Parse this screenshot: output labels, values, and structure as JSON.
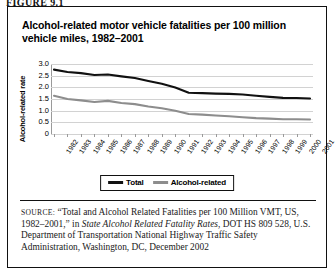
{
  "figure_label": "FIGURE 9.1",
  "title": "Alcohol-related motor vehicle fatalities per 100 million vehicle miles, 1982–2001",
  "legend": {
    "total_label": "Total",
    "alcohol_label": "Alcohol-related",
    "total_color": "#111111",
    "alcohol_color": "#8d8d8d"
  },
  "source": {
    "prefix": "SOURCE:",
    "part1": " “Total and Alcohol Related Fatalities per 100 Million VMT, US, 1982–2001,” in ",
    "italic": "State Alcohol Related Fatality Rates",
    "part2": ", DOT HS 809 528, U.S. Department of Transportation National Highway Traffic Safety Administration, Washington, DC, December 2002"
  },
  "chart_data": {
    "type": "line",
    "title": "",
    "xlabel": "",
    "ylabel": "Alcohol-related rate",
    "ylim": [
      0,
      3.0
    ],
    "ytick_labels": [
      "3.0",
      "2.5",
      "2.0",
      "1.5",
      "1.0",
      "0.5",
      "0"
    ],
    "ytick_values": [
      3.0,
      2.5,
      2.0,
      1.5,
      1.0,
      0.5,
      0
    ],
    "grid": true,
    "legend_position": "bottom",
    "categories": [
      "1982",
      "1983",
      "1984",
      "1985",
      "1986",
      "1987",
      "1988",
      "1989",
      "1990",
      "1991",
      "1992",
      "1993",
      "1994",
      "1995",
      "1996",
      "1997",
      "1998",
      "1999",
      "2000",
      "2001"
    ],
    "series": [
      {
        "name": "Total",
        "color": "#111111",
        "values": [
          2.76,
          2.66,
          2.61,
          2.53,
          2.55,
          2.47,
          2.4,
          2.27,
          2.15,
          1.99,
          1.77,
          1.75,
          1.73,
          1.72,
          1.69,
          1.64,
          1.59,
          1.55,
          1.54,
          1.52
        ]
      },
      {
        "name": "Alcohol-related",
        "color": "#8d8d8d",
        "values": [
          1.64,
          1.5,
          1.44,
          1.37,
          1.42,
          1.33,
          1.28,
          1.18,
          1.1,
          1.0,
          0.86,
          0.83,
          0.79,
          0.76,
          0.72,
          0.68,
          0.66,
          0.63,
          0.63,
          0.62
        ]
      }
    ]
  }
}
